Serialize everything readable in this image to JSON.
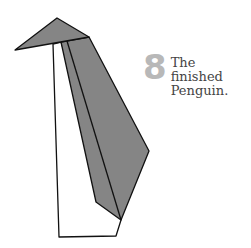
{
  "step": {
    "number": "8",
    "caption_line1": "The finished",
    "caption_line2": "Penguin."
  },
  "colors": {
    "fill_gray": "#858585",
    "stroke": "#111111",
    "step_number": "#b8b8b8",
    "background": "#ffffff"
  },
  "figure": {
    "parts": [
      "head",
      "white-body",
      "wing"
    ]
  }
}
